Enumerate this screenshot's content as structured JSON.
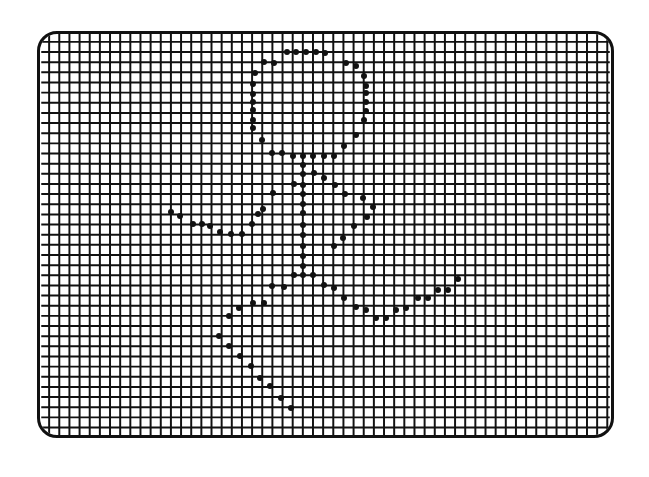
{
  "figure": {
    "grid": {
      "spacing": 10.3,
      "line_color": "#111111",
      "line_width": 2
    },
    "dot_color": "#111111",
    "dots": [
      [
        287,
        52
      ],
      [
        296,
        52
      ],
      [
        306,
        52
      ],
      [
        316,
        52
      ],
      [
        325,
        53
      ],
      [
        264,
        62
      ],
      [
        274,
        63
      ],
      [
        346,
        63
      ],
      [
        356,
        66
      ],
      [
        255,
        73
      ],
      [
        364,
        76
      ],
      [
        253,
        84
      ],
      [
        366,
        86
      ],
      [
        253,
        94
      ],
      [
        366,
        93
      ],
      [
        253,
        102
      ],
      [
        366,
        102
      ],
      [
        253,
        110
      ],
      [
        366,
        111
      ],
      [
        253,
        120
      ],
      [
        364,
        120
      ],
      [
        253,
        128
      ],
      [
        356,
        135
      ],
      [
        262,
        140
      ],
      [
        344,
        146
      ],
      [
        272,
        153
      ],
      [
        282,
        153
      ],
      [
        293,
        156
      ],
      [
        303,
        156
      ],
      [
        313,
        156
      ],
      [
        324,
        156
      ],
      [
        334,
        156
      ],
      [
        303,
        165
      ],
      [
        303,
        174
      ],
      [
        314,
        173
      ],
      [
        324,
        178
      ],
      [
        294,
        184
      ],
      [
        303,
        185
      ],
      [
        335,
        185
      ],
      [
        273,
        193
      ],
      [
        303,
        194
      ],
      [
        345,
        194
      ],
      [
        363,
        198
      ],
      [
        303,
        204
      ],
      [
        373,
        207
      ],
      [
        263,
        209
      ],
      [
        303,
        213
      ],
      [
        367,
        217
      ],
      [
        171,
        212
      ],
      [
        180,
        216
      ],
      [
        193,
        224
      ],
      [
        202,
        224
      ],
      [
        210,
        226
      ],
      [
        220,
        232
      ],
      [
        231,
        234
      ],
      [
        242,
        234
      ],
      [
        252,
        224
      ],
      [
        258,
        214
      ],
      [
        354,
        226
      ],
      [
        343,
        238
      ],
      [
        303,
        225
      ],
      [
        303,
        235
      ],
      [
        303,
        246
      ],
      [
        334,
        246
      ],
      [
        303,
        256
      ],
      [
        303,
        266
      ],
      [
        294,
        275
      ],
      [
        303,
        275
      ],
      [
        313,
        275
      ],
      [
        272,
        286
      ],
      [
        284,
        287
      ],
      [
        324,
        285
      ],
      [
        334,
        288
      ],
      [
        253,
        303
      ],
      [
        264,
        303
      ],
      [
        344,
        298
      ],
      [
        356,
        307
      ],
      [
        366,
        310
      ],
      [
        376,
        318
      ],
      [
        386,
        318
      ],
      [
        396,
        310
      ],
      [
        406,
        308
      ],
      [
        418,
        298
      ],
      [
        428,
        298
      ],
      [
        438,
        290
      ],
      [
        448,
        290
      ],
      [
        458,
        279
      ],
      [
        229,
        316
      ],
      [
        239,
        308
      ],
      [
        219,
        336
      ],
      [
        229,
        346
      ],
      [
        240,
        356
      ],
      [
        251,
        366
      ],
      [
        260,
        378
      ],
      [
        270,
        386
      ],
      [
        281,
        398
      ],
      [
        291,
        408
      ]
    ]
  }
}
